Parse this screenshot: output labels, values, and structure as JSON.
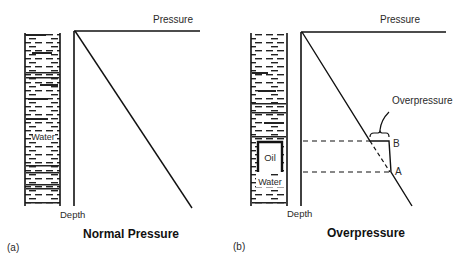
{
  "figure": {
    "panels": [
      {
        "id": "a",
        "panel_label": "(a)",
        "title": "Normal Pressure",
        "x_axis_label": "Pressure",
        "y_axis_label": "Depth",
        "column_label": "Water"
      },
      {
        "id": "b",
        "panel_label": "(b)",
        "title": "Overpressure",
        "x_axis_label": "Pressure",
        "y_axis_label": "Depth",
        "annotation": "Overpressure",
        "point_upper": "B",
        "point_lower": "A",
        "trap_label": "Oil",
        "column_label": "Water"
      }
    ],
    "colors": {
      "line": "#111111",
      "background": "#ffffff",
      "text": "#2a2a2a"
    }
  }
}
